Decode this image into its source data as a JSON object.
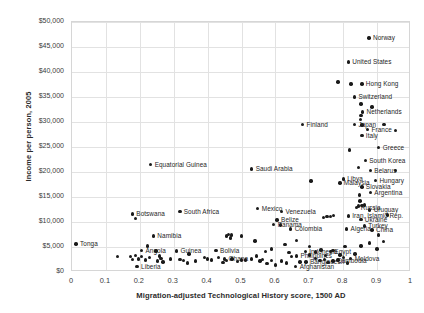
{
  "chart_data": {
    "type": "scatter",
    "title": "",
    "xlabel": "Migration-adjusted Technological History score, 1500 AD",
    "ylabel": "Income per person, 2005",
    "xlim": [
      0,
      1
    ],
    "ylim": [
      0,
      50000
    ],
    "xticks": [
      "0",
      "0.1",
      "0.2",
      "0.3",
      "0.4",
      "0.5",
      "0.6",
      "0.7",
      "0.8",
      "0.9",
      "1"
    ],
    "xtick_values": [
      0,
      0.1,
      0.2,
      0.3,
      0.4,
      0.5,
      0.6,
      0.7,
      0.8,
      0.9,
      1
    ],
    "yticks": [
      "$0",
      "$5,000",
      "$10,000",
      "$15,000",
      "$20,000",
      "$25,000",
      "$30,000",
      "$35,000",
      "$40,000",
      "$45,000",
      "$50,000"
    ],
    "ytick_values": [
      0,
      5000,
      10000,
      15000,
      20000,
      25000,
      30000,
      35000,
      40000,
      45000,
      50000
    ],
    "grid": true,
    "legend": "none",
    "marker_color": "#1a1a1a",
    "points": [
      {
        "label": "Norway",
        "x": 0.876,
        "y": 46800,
        "pos": "right"
      },
      {
        "label": "United States",
        "x": 0.815,
        "y": 42000,
        "pos": "right"
      },
      {
        "label": "Hong Kong",
        "x": 0.855,
        "y": 37600,
        "pos": "right"
      },
      {
        "label": "",
        "x": 0.823,
        "y": 37600,
        "pos": "right"
      },
      {
        "label": "",
        "x": 0.785,
        "y": 38000,
        "pos": "right"
      },
      {
        "label": "Switzerland",
        "x": 0.833,
        "y": 35000,
        "pos": "right"
      },
      {
        "label": "",
        "x": 0.852,
        "y": 33600,
        "pos": "right"
      },
      {
        "label": "",
        "x": 0.885,
        "y": 33000,
        "pos": "right"
      },
      {
        "label": "Netherlands",
        "x": 0.857,
        "y": 32000,
        "pos": "right"
      },
      {
        "label": "",
        "x": 0.852,
        "y": 31300,
        "pos": "right"
      },
      {
        "label": "",
        "x": 0.851,
        "y": 30500,
        "pos": "right"
      },
      {
        "label": "Japan",
        "x": 0.833,
        "y": 29500,
        "pos": "right"
      },
      {
        "label": "Finland",
        "x": 0.68,
        "y": 29500,
        "pos": "right"
      },
      {
        "label": "",
        "x": 0.855,
        "y": 29400,
        "pos": "right"
      },
      {
        "label": "France",
        "x": 0.872,
        "y": 28500,
        "pos": "right"
      },
      {
        "label": "",
        "x": 0.92,
        "y": 29500,
        "pos": "right"
      },
      {
        "label": "",
        "x": 0.955,
        "y": 28300,
        "pos": "right"
      },
      {
        "label": "Italy",
        "x": 0.855,
        "y": 27300,
        "pos": "right"
      },
      {
        "label": "Greece",
        "x": 0.905,
        "y": 24900,
        "pos": "right"
      },
      {
        "label": "",
        "x": 0.818,
        "y": 24400,
        "pos": "right"
      },
      {
        "label": "South Korea",
        "x": 0.865,
        "y": 22300,
        "pos": "right"
      },
      {
        "label": "Equatorial Guinea",
        "x": 0.232,
        "y": 21500,
        "pos": "right"
      },
      {
        "label": "Belarus",
        "x": 0.88,
        "y": 20300,
        "pos": "right"
      },
      {
        "label": "",
        "x": 0.845,
        "y": 20900,
        "pos": "right"
      },
      {
        "label": "",
        "x": 0.955,
        "y": 20300,
        "pos": "right"
      },
      {
        "label": "Saudi Arabia",
        "x": 0.53,
        "y": 20600,
        "pos": "right"
      },
      {
        "label": "Hungary",
        "x": 0.895,
        "y": 18300,
        "pos": "right"
      },
      {
        "label": "Libya",
        "x": 0.8,
        "y": 18600,
        "pos": "right"
      },
      {
        "label": "Malaysia",
        "x": 0.79,
        "y": 17800,
        "pos": "right"
      },
      {
        "label": "",
        "x": 0.705,
        "y": 18200,
        "pos": "right"
      },
      {
        "label": "Slovakia",
        "x": 0.855,
        "y": 17000,
        "pos": "right"
      },
      {
        "label": "Argentina",
        "x": 0.88,
        "y": 15900,
        "pos": "right"
      },
      {
        "label": "",
        "x": 0.848,
        "y": 15400,
        "pos": "right"
      },
      {
        "label": "",
        "x": 0.85,
        "y": 14200,
        "pos": "right"
      },
      {
        "label": "Uruguay",
        "x": 0.878,
        "y": 12400,
        "pos": "right"
      },
      {
        "label": "Russia",
        "x": 0.84,
        "y": 12900,
        "pos": "right"
      },
      {
        "label": "",
        "x": 0.855,
        "y": 13300,
        "pos": "right"
      },
      {
        "label": "",
        "x": 0.862,
        "y": 13400,
        "pos": "right"
      },
      {
        "label": "",
        "x": 0.846,
        "y": 13200,
        "pos": "right"
      },
      {
        "label": "Venezuela",
        "x": 0.618,
        "y": 12100,
        "pos": "right"
      },
      {
        "label": "Mexico",
        "x": 0.548,
        "y": 12700,
        "pos": "right"
      },
      {
        "label": "South Africa",
        "x": 0.318,
        "y": 12100,
        "pos": "right"
      },
      {
        "label": "Iran, Islamic Rep.",
        "x": 0.815,
        "y": 11200,
        "pos": "right"
      },
      {
        "label": "Ukraine",
        "x": 0.852,
        "y": 10500,
        "pos": "right"
      },
      {
        "label": "Belize",
        "x": 0.605,
        "y": 10400,
        "pos": "right"
      },
      {
        "label": "Panama",
        "x": 0.595,
        "y": 9500,
        "pos": "right"
      },
      {
        "label": "",
        "x": 0.742,
        "y": 10900,
        "pos": "right"
      },
      {
        "label": "",
        "x": 0.752,
        "y": 11100,
        "pos": "right"
      },
      {
        "label": "",
        "x": 0.762,
        "y": 11100,
        "pos": "right"
      },
      {
        "label": "",
        "x": 0.772,
        "y": 11300,
        "pos": "right"
      },
      {
        "label": "Turkey",
        "x": 0.862,
        "y": 9200,
        "pos": "right"
      },
      {
        "label": "China",
        "x": 0.885,
        "y": 8400,
        "pos": "right"
      },
      {
        "label": "Algeria",
        "x": 0.81,
        "y": 8600,
        "pos": "right"
      },
      {
        "label": "Colombia",
        "x": 0.645,
        "y": 8600,
        "pos": "right"
      },
      {
        "label": "",
        "x": 0.615,
        "y": 9400,
        "pos": "right"
      },
      {
        "label": "Botswana",
        "x": 0.178,
        "y": 11600,
        "pos": "right"
      },
      {
        "label": "",
        "x": 0.188,
        "y": 10700,
        "pos": "right"
      },
      {
        "label": "Namibia",
        "x": 0.24,
        "y": 7200,
        "pos": "right"
      },
      {
        "label": "Tonga",
        "x": 0.012,
        "y": 5600,
        "pos": "right"
      },
      {
        "label": "Guinea",
        "x": 0.308,
        "y": 4200,
        "pos": "right"
      },
      {
        "label": "Angola",
        "x": 0.205,
        "y": 4300,
        "pos": "right"
      },
      {
        "label": "Bolivia",
        "x": 0.425,
        "y": 4300,
        "pos": "right"
      },
      {
        "label": "Ghana",
        "x": 0.45,
        "y": 2600,
        "pos": "right"
      },
      {
        "label": "Liberia",
        "x": 0.192,
        "y": 1100,
        "pos": "right"
      },
      {
        "label": "Indonesia",
        "x": 0.688,
        "y": 4100,
        "pos": "right"
      },
      {
        "label": "Egypt",
        "x": 0.762,
        "y": 4100,
        "pos": "right"
      },
      {
        "label": "Philippines",
        "x": 0.662,
        "y": 3200,
        "pos": "right"
      },
      {
        "label": "Bangladesh",
        "x": 0.69,
        "y": 2000,
        "pos": "right"
      },
      {
        "label": "Cambodia",
        "x": 0.77,
        "y": 2200,
        "pos": "right"
      },
      {
        "label": "Moldova",
        "x": 0.822,
        "y": 2700,
        "pos": "right"
      },
      {
        "label": "Afghanistan",
        "x": 0.66,
        "y": 1100,
        "pos": "right"
      },
      {
        "label": "",
        "x": 0.455,
        "y": 7200,
        "pos": "right"
      },
      {
        "label": "",
        "x": 0.462,
        "y": 7500,
        "pos": "right"
      },
      {
        "label": "",
        "x": 0.468,
        "y": 6800,
        "pos": "right"
      },
      {
        "label": "",
        "x": 0.47,
        "y": 7400,
        "pos": "right"
      },
      {
        "label": "",
        "x": 0.5,
        "y": 7200,
        "pos": "right"
      },
      {
        "label": "",
        "x": 0.54,
        "y": 6200,
        "pos": "right"
      },
      {
        "label": "",
        "x": 0.135,
        "y": 3100,
        "pos": "right"
      },
      {
        "label": "",
        "x": 0.172,
        "y": 3100,
        "pos": "right"
      },
      {
        "label": "",
        "x": 0.178,
        "y": 2500,
        "pos": "right"
      },
      {
        "label": "",
        "x": 0.188,
        "y": 3300,
        "pos": "right"
      },
      {
        "label": "",
        "x": 0.196,
        "y": 2600,
        "pos": "right"
      },
      {
        "label": "",
        "x": 0.205,
        "y": 3100,
        "pos": "right"
      },
      {
        "label": "",
        "x": 0.216,
        "y": 2400,
        "pos": "right"
      },
      {
        "label": "",
        "x": 0.228,
        "y": 2900,
        "pos": "right"
      },
      {
        "label": "",
        "x": 0.252,
        "y": 2200,
        "pos": "right"
      },
      {
        "label": "",
        "x": 0.258,
        "y": 3200,
        "pos": "right"
      },
      {
        "label": "",
        "x": 0.262,
        "y": 2700,
        "pos": "right"
      },
      {
        "label": "",
        "x": 0.268,
        "y": 2000,
        "pos": "right"
      },
      {
        "label": "",
        "x": 0.29,
        "y": 2600,
        "pos": "right"
      },
      {
        "label": "",
        "x": 0.318,
        "y": 2500,
        "pos": "right"
      },
      {
        "label": "",
        "x": 0.328,
        "y": 2300,
        "pos": "right"
      },
      {
        "label": "",
        "x": 0.34,
        "y": 1800,
        "pos": "right"
      },
      {
        "label": "",
        "x": 0.39,
        "y": 2900,
        "pos": "right"
      },
      {
        "label": "",
        "x": 0.4,
        "y": 2600,
        "pos": "right"
      },
      {
        "label": "",
        "x": 0.412,
        "y": 2400,
        "pos": "right"
      },
      {
        "label": "",
        "x": 0.432,
        "y": 2900,
        "pos": "right"
      },
      {
        "label": "",
        "x": 0.445,
        "y": 1900,
        "pos": "right"
      },
      {
        "label": "",
        "x": 0.455,
        "y": 2300,
        "pos": "right"
      },
      {
        "label": "",
        "x": 0.472,
        "y": 2600,
        "pos": "right"
      },
      {
        "label": "",
        "x": 0.488,
        "y": 2100,
        "pos": "right"
      },
      {
        "label": "",
        "x": 0.5,
        "y": 2400,
        "pos": "right"
      },
      {
        "label": "",
        "x": 0.512,
        "y": 2400,
        "pos": "right"
      },
      {
        "label": "",
        "x": 0.53,
        "y": 2600,
        "pos": "right"
      },
      {
        "label": "",
        "x": 0.545,
        "y": 3200,
        "pos": "right"
      },
      {
        "label": "",
        "x": 0.555,
        "y": 2200,
        "pos": "right"
      },
      {
        "label": "",
        "x": 0.562,
        "y": 2500,
        "pos": "right"
      },
      {
        "label": "",
        "x": 0.575,
        "y": 1700,
        "pos": "right"
      },
      {
        "label": "",
        "x": 0.588,
        "y": 2300,
        "pos": "right"
      },
      {
        "label": "",
        "x": 0.6,
        "y": 1400,
        "pos": "right"
      },
      {
        "label": "",
        "x": 0.618,
        "y": 2200,
        "pos": "right"
      },
      {
        "label": "",
        "x": 0.632,
        "y": 1800,
        "pos": "right"
      },
      {
        "label": "",
        "x": 0.648,
        "y": 3100,
        "pos": "right"
      },
      {
        "label": "",
        "x": 0.672,
        "y": 2000,
        "pos": "right"
      },
      {
        "label": "",
        "x": 0.7,
        "y": 3400,
        "pos": "right"
      },
      {
        "label": "",
        "x": 0.718,
        "y": 2700,
        "pos": "right"
      },
      {
        "label": "",
        "x": 0.732,
        "y": 2300,
        "pos": "right"
      },
      {
        "label": "",
        "x": 0.745,
        "y": 2500,
        "pos": "right"
      },
      {
        "label": "",
        "x": 0.755,
        "y": 1900,
        "pos": "right"
      },
      {
        "label": "",
        "x": 0.785,
        "y": 2400,
        "pos": "right"
      },
      {
        "label": "",
        "x": 0.8,
        "y": 2900,
        "pos": "right"
      },
      {
        "label": "",
        "x": 0.812,
        "y": 1800,
        "pos": "right"
      },
      {
        "label": "",
        "x": 0.835,
        "y": 3600,
        "pos": "right"
      },
      {
        "label": "",
        "x": 0.852,
        "y": 5200,
        "pos": "right"
      },
      {
        "label": "",
        "x": 0.878,
        "y": 5800,
        "pos": "right"
      },
      {
        "label": "",
        "x": 0.9,
        "y": 4600,
        "pos": "right"
      },
      {
        "label": "",
        "x": 0.918,
        "y": 6100,
        "pos": "right"
      },
      {
        "label": "",
        "x": 0.905,
        "y": 7400,
        "pos": "right"
      },
      {
        "label": "",
        "x": 0.93,
        "y": 11400,
        "pos": "right"
      },
      {
        "label": "",
        "x": 0.628,
        "y": 5500,
        "pos": "right"
      },
      {
        "label": "",
        "x": 0.588,
        "y": 4600,
        "pos": "right"
      },
      {
        "label": "",
        "x": 0.57,
        "y": 4100,
        "pos": "right"
      },
      {
        "label": "",
        "x": 0.662,
        "y": 6300,
        "pos": "right"
      },
      {
        "label": "",
        "x": 0.7,
        "y": 5100,
        "pos": "right"
      },
      {
        "label": "",
        "x": 0.718,
        "y": 4000,
        "pos": "right"
      },
      {
        "label": "",
        "x": 0.735,
        "y": 4400,
        "pos": "right"
      },
      {
        "label": "",
        "x": 0.748,
        "y": 3300,
        "pos": "right"
      },
      {
        "label": "",
        "x": 0.77,
        "y": 4300,
        "pos": "right"
      },
      {
        "label": "",
        "x": 0.79,
        "y": 3400,
        "pos": "right"
      },
      {
        "label": "",
        "x": 0.805,
        "y": 5100,
        "pos": "right"
      },
      {
        "label": "",
        "x": 0.64,
        "y": 3900,
        "pos": "right"
      },
      {
        "label": "",
        "x": 0.345,
        "y": 3600,
        "pos": "right"
      },
      {
        "label": "",
        "x": 0.365,
        "y": 2200,
        "pos": "right"
      },
      {
        "label": "",
        "x": 0.248,
        "y": 4200,
        "pos": "right"
      },
      {
        "label": "",
        "x": 0.222,
        "y": 5200,
        "pos": "right"
      }
    ]
  }
}
